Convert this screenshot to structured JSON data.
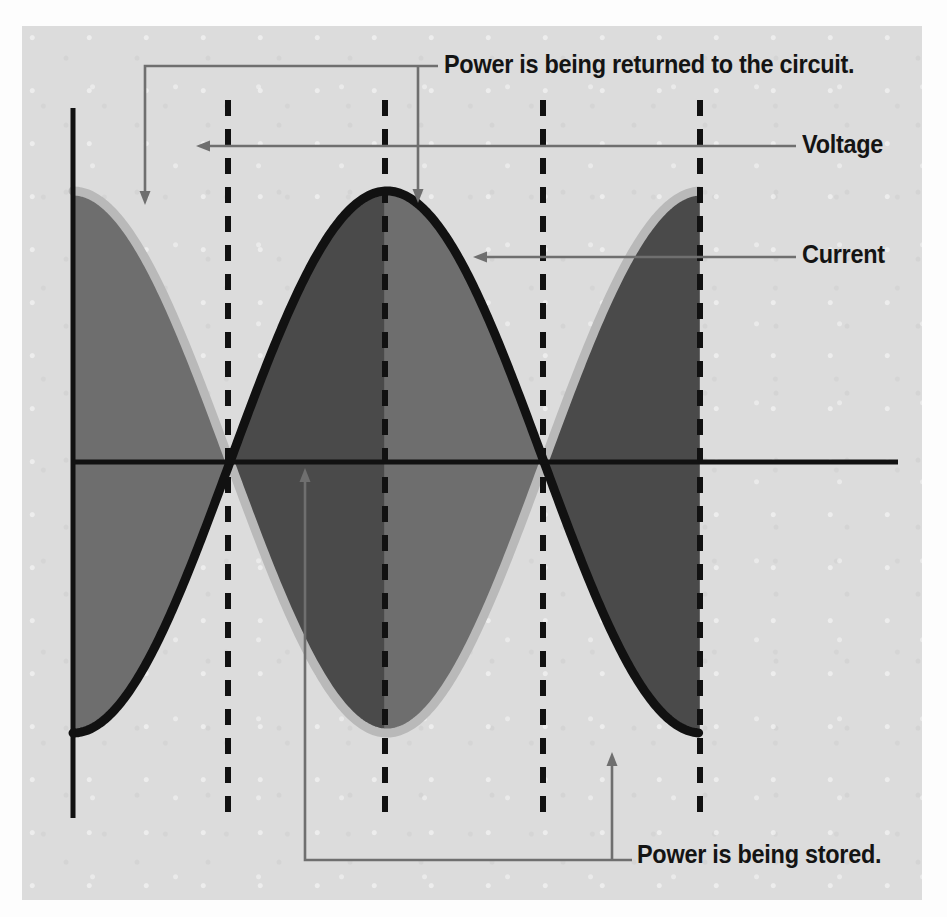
{
  "figure": {
    "background_color": "#dcdcdc",
    "page_color": "#fdfdfd"
  },
  "annotations": {
    "power_returned": "Power is being returned to the circuit.",
    "voltage": "Voltage",
    "current": "Current",
    "power_stored": "Power is being stored."
  },
  "colors": {
    "axis": "#111111",
    "current_curve": "#111111",
    "voltage_curve": "#b9b9b9",
    "shade_stored": "#4a4a4a",
    "shade_returned": "#6e6e6e",
    "leader": "#6f6f6f",
    "dashed": "#111111",
    "label_text": "#141414"
  },
  "chart_data": {
    "type": "line",
    "title": "",
    "xlabel": "",
    "ylabel": "",
    "grid": false,
    "legend_position": "right-callouts",
    "axes": {
      "x_axis_y_px": 462,
      "y_axis_x_px": 73,
      "x_axis_from_px": 73,
      "x_axis_to_px": 898,
      "y_axis_top_px": 108,
      "y_axis_bottom_px": 818,
      "amplitude_px": 271,
      "period_px": 628,
      "quarter_period_px": 157,
      "x_range_px": [
        73,
        700
      ]
    },
    "phase": {
      "description": "Voltage leads current by 90 degrees (quarter cycle).",
      "voltage_phase_deg": 90,
      "current_phase_deg": 0,
      "lead_deg": 90
    },
    "series": [
      {
        "name": "Voltage",
        "style": "light-gray outline",
        "color": "#b9b9b9",
        "equation": "v(t) = A cos(2*pi*t/T)",
        "key_points_deg": [
          {
            "deg": 0,
            "x_px": 73,
            "value": 0,
            "note": "zero, rising"
          },
          {
            "deg": 90,
            "x_px": 228,
            "value": 1,
            "note": "positive peak"
          },
          {
            "deg": 180,
            "x_px": 385,
            "value": 0,
            "note": "zero, falling"
          },
          {
            "deg": 270,
            "x_px": 543,
            "value": -1,
            "note": "negative peak"
          },
          {
            "deg": 360,
            "x_px": 700,
            "value": 0,
            "note": "zero, rising"
          }
        ]
      },
      {
        "name": "Current",
        "style": "thick black line",
        "color": "#111111",
        "equation": "i(t) = A sin(2*pi*t/T - pi/2)",
        "key_points_deg": [
          {
            "deg": 0,
            "x_px": 73,
            "value": -1,
            "note": "negative peak"
          },
          {
            "deg": 90,
            "x_px": 228,
            "value": 0,
            "note": "zero, rising"
          },
          {
            "deg": 180,
            "x_px": 385,
            "value": 1,
            "note": "positive peak"
          },
          {
            "deg": 270,
            "x_px": 543,
            "value": 0,
            "note": "zero, falling"
          },
          {
            "deg": 360,
            "x_px": 700,
            "value": -1,
            "note": "negative peak"
          }
        ]
      }
    ],
    "markers": {
      "dashed_verticals_x_px": [
        228,
        385,
        543,
        700
      ],
      "dashed_verticals_deg": [
        90,
        180,
        270,
        360
      ]
    },
    "regions": [
      {
        "label": "Power is being returned to the circuit.",
        "from_x_px": 73,
        "to_x_px": 228,
        "shade": "#6e6e6e",
        "sign": "negative"
      },
      {
        "label": "Power is being stored.",
        "from_x_px": 228,
        "to_x_px": 385,
        "shade": "#4a4a4a",
        "sign": "positive"
      },
      {
        "label": "Power is being returned to the circuit.",
        "from_x_px": 385,
        "to_x_px": 543,
        "shade": "#6e6e6e",
        "sign": "negative"
      },
      {
        "label": "Power is being stored.",
        "from_x_px": 543,
        "to_x_px": 700,
        "shade": "#4a4a4a",
        "sign": "positive"
      }
    ],
    "callouts": [
      {
        "name": "power-returned",
        "text": "Power is being returned to the circuit.",
        "bracket_y_px": 66,
        "arrow_xs_px": [
          145,
          418
        ],
        "arrow_dir": "down"
      },
      {
        "name": "voltage",
        "text": "Voltage",
        "leader_y_px": 146,
        "arrow_x_px": 202,
        "arrow_dir": "left"
      },
      {
        "name": "current",
        "text": "Current",
        "leader_y_px": 257,
        "arrow_x_px": 479,
        "arrow_dir": "left"
      },
      {
        "name": "power-stored",
        "text": "Power is being stored.",
        "bracket_y_px": 860,
        "arrow_xs_px": [
          305,
          612
        ],
        "arrow_dir": "up"
      }
    ]
  }
}
